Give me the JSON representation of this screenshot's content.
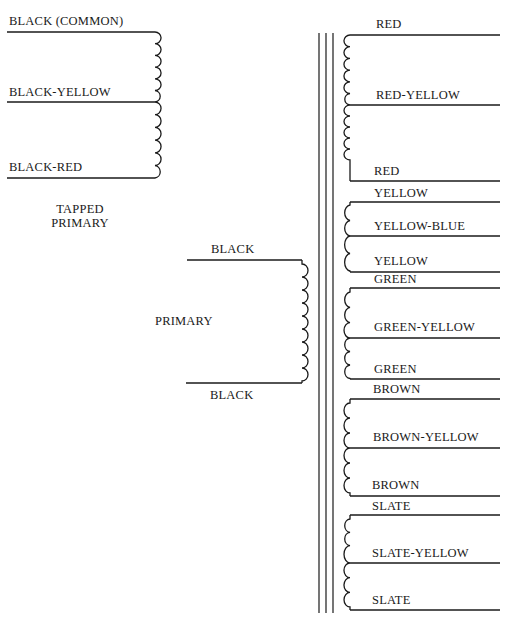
{
  "diagram": {
    "tapped_primary": {
      "caption_line1": "TAPPED",
      "caption_line2": "PRIMARY",
      "leads": [
        "BLACK (COMMON)",
        "BLACK-YELLOW",
        "BLACK-RED"
      ]
    },
    "primary": {
      "caption": "PRIMARY",
      "leads": [
        "BLACK",
        "BLACK"
      ]
    },
    "secondaries": [
      {
        "leads": [
          "RED",
          "RED-YELLOW",
          "RED"
        ]
      },
      {
        "leads": [
          "YELLOW",
          "YELLOW-BLUE",
          "YELLOW"
        ]
      },
      {
        "leads": [
          "GREEN",
          "GREEN-YELLOW",
          "GREEN"
        ]
      },
      {
        "leads": [
          "BROWN",
          "BROWN-YELLOW",
          "BROWN"
        ]
      },
      {
        "leads": [
          "SLATE",
          "SLATE-YELLOW",
          "SLATE"
        ]
      }
    ],
    "colors": {
      "ink": "#1a1a1a",
      "paper": "#ffffff"
    }
  }
}
